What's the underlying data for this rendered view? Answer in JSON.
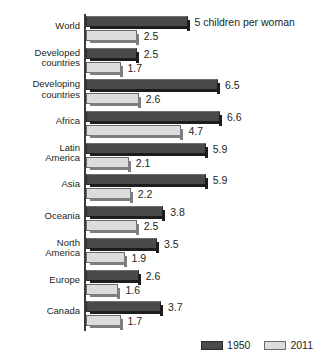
{
  "chart_data": {
    "type": "bar",
    "orientation": "horizontal",
    "title": "",
    "subtitle": "",
    "xlabel": "",
    "ylabel": "",
    "xlim": [
      0,
      6.6
    ],
    "grid": false,
    "legend_position": "bottom-right",
    "annotation": "5 children per woman",
    "categories": [
      "World",
      "Developed\ncountries",
      "Developing\ncountries",
      "Africa",
      "Latin\nAmerica",
      "Asia",
      "Oceania",
      "North\nAmerica",
      "Europe",
      "Canada"
    ],
    "series": [
      {
        "name": "1950",
        "color": "#4a4a4a",
        "values": [
          5,
          2.5,
          6.5,
          6.6,
          5.9,
          5.9,
          3.8,
          3.5,
          2.6,
          3.7
        ],
        "labels": [
          "",
          "2.5",
          "6.5",
          "6.6",
          "5.9",
          "5.9",
          "3.8",
          "3.5",
          "2.6",
          "3.7"
        ]
      },
      {
        "name": "2011",
        "color": "#dcdcdc",
        "values": [
          2.5,
          1.7,
          2.6,
          4.7,
          2.1,
          2.2,
          2.5,
          1.9,
          1.6,
          1.7
        ],
        "labels": [
          "2.5",
          "1.7",
          "2.6",
          "4.7",
          "2.1",
          "2.2",
          "2.5",
          "1.9",
          "1.6",
          "1.7"
        ]
      }
    ]
  },
  "legend": {
    "items": [
      {
        "label": "1950",
        "color": "#4a4a4a"
      },
      {
        "label": "2011",
        "color": "#dcdcdc"
      }
    ]
  }
}
